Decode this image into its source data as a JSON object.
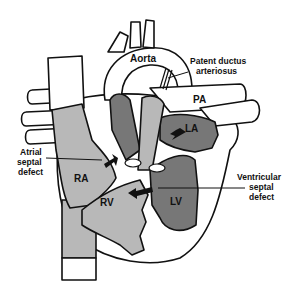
{
  "diagram": {
    "colors": {
      "light_chamber": "#b8b8b8",
      "dark_chamber": "#777777",
      "vessel": "#ffffff",
      "outline": "#111111"
    },
    "labels": {
      "aorta": "Aorta",
      "pda_line1": "Patent ductus",
      "pda_line2": "arteriosus",
      "pa": "PA",
      "la": "LA",
      "ra": "RA",
      "rv": "RV",
      "lv": "LV",
      "asd_line1": "Atrial",
      "asd_line2": "septal",
      "asd_line3": "defect",
      "vsd_line1": "Ventricular",
      "vsd_line2": "septal",
      "vsd_line3": "defect"
    }
  }
}
